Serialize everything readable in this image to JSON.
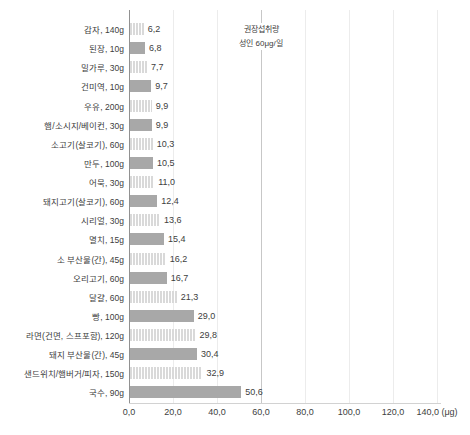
{
  "chart_data": {
    "type": "bar",
    "orientation": "horizontal",
    "title": "",
    "xlabel_unit": "μg",
    "xlim": [
      0,
      140
    ],
    "grid": "vertical",
    "x_ticks": [
      0,
      20,
      40,
      60,
      80,
      100,
      120,
      140
    ],
    "x_tick_labels": [
      "0,0",
      "20,0",
      "40,0",
      "60,0",
      "80,0",
      "100,0",
      "120,0",
      "140,0 (μg)"
    ],
    "reference_line": {
      "x": 60,
      "label_line1": "권장섭취량",
      "label_line2": "성인 60μg/일"
    },
    "items": [
      {
        "category": "감자, 140g",
        "value": 6.2,
        "value_label": "6,2",
        "fill": "hatched"
      },
      {
        "category": "된장, 10g",
        "value": 6.8,
        "value_label": "6,8",
        "fill": "solid"
      },
      {
        "category": "밀가루, 30g",
        "value": 7.7,
        "value_label": "7,7",
        "fill": "hatched"
      },
      {
        "category": "건미역, 10g",
        "value": 9.7,
        "value_label": "9,7",
        "fill": "solid"
      },
      {
        "category": "우유, 200g",
        "value": 9.9,
        "value_label": "9,9",
        "fill": "hatched"
      },
      {
        "category": "햄/소시지/베이컨, 30g",
        "value": 9.9,
        "value_label": "9,9",
        "fill": "solid"
      },
      {
        "category": "소고기(살코기), 60g",
        "value": 10.3,
        "value_label": "10,3",
        "fill": "hatched"
      },
      {
        "category": "만두, 100g",
        "value": 10.5,
        "value_label": "10,5",
        "fill": "solid"
      },
      {
        "category": "어묵, 30g",
        "value": 11.0,
        "value_label": "11,0",
        "fill": "hatched"
      },
      {
        "category": "돼지고기(살코기), 60g",
        "value": 12.4,
        "value_label": "12,4",
        "fill": "solid"
      },
      {
        "category": "시리얼, 30g",
        "value": 13.6,
        "value_label": "13,6",
        "fill": "hatched"
      },
      {
        "category": "멸치, 15g",
        "value": 15.4,
        "value_label": "15,4",
        "fill": "solid"
      },
      {
        "category": "소 부산물(간), 45g",
        "value": 16.2,
        "value_label": "16,2",
        "fill": "hatched"
      },
      {
        "category": "오리고기, 60g",
        "value": 16.7,
        "value_label": "16,7",
        "fill": "solid"
      },
      {
        "category": "달걀, 60g",
        "value": 21.3,
        "value_label": "21,3",
        "fill": "hatched"
      },
      {
        "category": "빵, 100g",
        "value": 29.0,
        "value_label": "29,0",
        "fill": "solid"
      },
      {
        "category": "라면(건면, 스프포함), 120g",
        "value": 29.8,
        "value_label": "29,8",
        "fill": "hatched"
      },
      {
        "category": "돼지 부산물(간), 45g",
        "value": 30.4,
        "value_label": "30,4",
        "fill": "solid"
      },
      {
        "category": "샌드위치/햄버거/피자, 150g",
        "value": 32.9,
        "value_label": "32,9",
        "fill": "hatched"
      },
      {
        "category": "국수, 90g",
        "value": 50.6,
        "value_label": "50,6",
        "fill": "solid"
      }
    ]
  },
  "colors": {
    "bar_solid": "#a8a8a8",
    "bar_hatch_base": "#d9d9d9",
    "bar_hatch_stripe": "#ffffff",
    "gridline": "#ececec",
    "axis_line": "#919191",
    "baseline": "#d2d2d2",
    "reference_line": "#c7c7c7",
    "text": "#404040"
  }
}
